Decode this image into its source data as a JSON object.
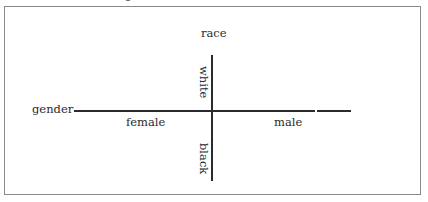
{
  "diagram": {
    "type": "two-axis conceptual diagram",
    "horizontal_axis": {
      "name": "gender",
      "negative_label": "female",
      "positive_label": "male"
    },
    "vertical_axis": {
      "name": "race",
      "positive_label": "white",
      "negative_label": "black"
    }
  },
  "colors": {
    "line": "#2b2b2b",
    "frame": "#8a8a8a",
    "text": "#2a2a2a",
    "background": "#ffffff"
  }
}
